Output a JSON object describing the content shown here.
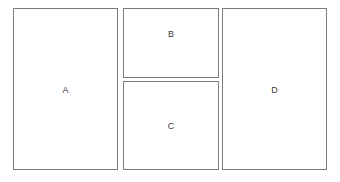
{
  "diagram": {
    "background_color": "#ffffff",
    "stroke_color": "#7b7b7b",
    "label_color": "#3c3c3c",
    "regions": [
      {
        "id": "A",
        "label": "A",
        "position": "left",
        "shape": "rectangle",
        "x": 13,
        "y": 8,
        "width": 105,
        "height": 162
      },
      {
        "id": "B",
        "label": "B",
        "position": "top-middle",
        "shape": "rectangle",
        "x": 123,
        "y": 8,
        "width": 96,
        "height": 70
      },
      {
        "id": "C",
        "label": "C",
        "position": "bottom-middle",
        "shape": "rectangle",
        "x": 123,
        "y": 81,
        "width": 96,
        "height": 89
      },
      {
        "id": "D",
        "label": "D",
        "position": "right",
        "shape": "rectangle",
        "x": 222,
        "y": 8,
        "width": 105,
        "height": 162
      }
    ]
  }
}
